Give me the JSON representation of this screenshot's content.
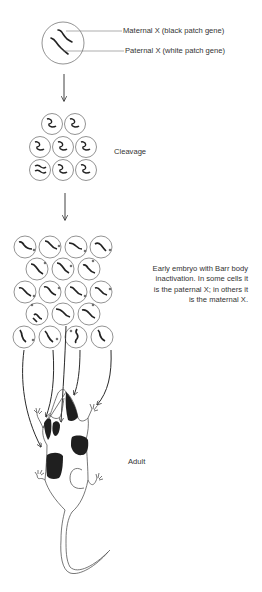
{
  "labels": {
    "maternal_x": "Maternal X (black patch gene)",
    "paternal_x": "Paternal X (white patch gene)",
    "cleavage": "Cleavage",
    "embryo_caption": [
      "Early embryo with Barr body",
      "inactivation.  In some cells it",
      "is the paternal X; in others it",
      "is the maternal X."
    ],
    "adult": "Adult"
  },
  "stages": [
    {
      "name": "zygote",
      "cells": 1
    },
    {
      "name": "cleavage",
      "cells": 8,
      "rows": [
        2,
        3,
        3
      ]
    },
    {
      "name": "early-embryo",
      "cells": 18,
      "rows": [
        4,
        3,
        4,
        3,
        4
      ]
    },
    {
      "name": "adult",
      "description": "calico mouse with black and white patches"
    }
  ],
  "colors": {
    "ink": "#2a2a2a",
    "outline": "#666666",
    "patch": "#1f1f1f",
    "background": "#ffffff"
  }
}
